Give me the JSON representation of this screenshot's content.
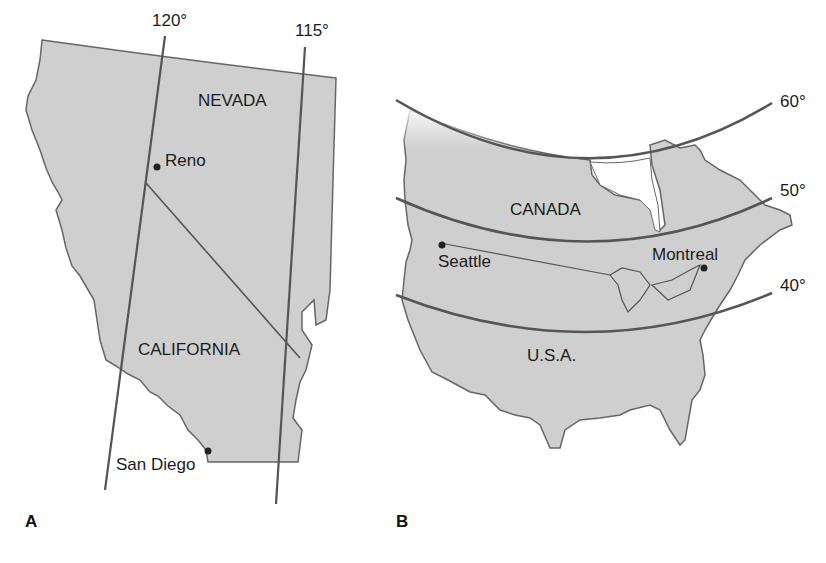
{
  "figure": {
    "colors": {
      "land": "#cfcfcf",
      "outline": "#555555",
      "meridian": "#555555",
      "text": "#1c1c1c",
      "background": "#ffffff"
    },
    "panel_a": {
      "panel_label": "A",
      "states": [
        "NEVADA",
        "CALIFORNIA"
      ],
      "cities": [
        {
          "name": "Reno"
        },
        {
          "name": "San Diego"
        }
      ],
      "meridians": [
        {
          "label": "120°"
        },
        {
          "label": "115°"
        }
      ]
    },
    "panel_b": {
      "panel_label": "B",
      "countries": [
        "CANADA",
        "U.S.A."
      ],
      "cities": [
        {
          "name": "Seattle"
        },
        {
          "name": "Montreal"
        }
      ],
      "parallels": [
        {
          "label": "60°"
        },
        {
          "label": "50°"
        },
        {
          "label": "40°"
        }
      ]
    }
  }
}
